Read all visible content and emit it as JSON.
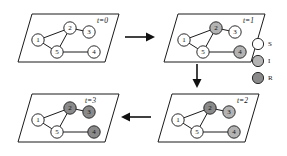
{
  "figure": {
    "colors": {
      "susceptible": "#ffffff",
      "infected": "#b3b3b3",
      "recovered": "#8a8a8a",
      "stroke": "#2b2b2b",
      "edge": "#1a1a1a",
      "frame": "#1a1a1a",
      "arrow": "#111111",
      "background": "#ffffff"
    },
    "node_ids": [
      "1",
      "2",
      "3",
      "4",
      "5"
    ],
    "edges": [
      {
        "from": "1",
        "to": "2"
      },
      {
        "from": "1",
        "to": "5"
      },
      {
        "from": "2",
        "to": "5"
      },
      {
        "from": "2",
        "to": "3"
      },
      {
        "from": "5",
        "to": "4"
      }
    ],
    "panels": [
      {
        "id": "panel-t0",
        "time_label": "t=0",
        "states": {
          "1": "S",
          "2": "S",
          "3": "S",
          "4": "S",
          "5": "S"
        }
      },
      {
        "id": "panel-t1",
        "time_label": "t=1",
        "states": {
          "1": "S",
          "2": "I",
          "3": "S",
          "4": "I",
          "5": "S"
        }
      },
      {
        "id": "panel-t2",
        "time_label": "t=2",
        "states": {
          "1": "S",
          "2": "R",
          "3": "I",
          "4": "I",
          "5": "S"
        }
      },
      {
        "id": "panel-t3",
        "time_label": "t=3",
        "states": {
          "1": "S",
          "2": "R",
          "3": "R",
          "4": "R",
          "5": "S"
        }
      }
    ],
    "arrows": [
      {
        "id": "arrow-t0-t1",
        "direction": "right"
      },
      {
        "id": "arrow-t1-t2",
        "direction": "down"
      },
      {
        "id": "arrow-t2-t3",
        "direction": "left"
      }
    ],
    "legend": {
      "items": [
        {
          "key": "S",
          "label": "S",
          "fill": "#ffffff"
        },
        {
          "key": "I",
          "label": "I",
          "fill": "#b3b3b3"
        },
        {
          "key": "R",
          "label": "R",
          "fill": "#8a8a8a"
        }
      ]
    }
  }
}
